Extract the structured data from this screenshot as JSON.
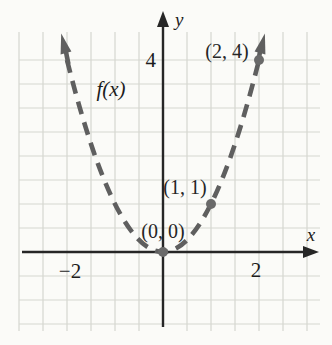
{
  "figure_title": "Graph of f(x) dashed parabola with marked points",
  "chart_data": {
    "type": "line",
    "curve_equation": "f(x) = x^2",
    "curve_label": "f(x)",
    "line_style": "dashed",
    "x_axis_label": "x",
    "y_axis_label": "y",
    "x_ticks": [
      {
        "value": -2,
        "label": "−2"
      },
      {
        "value": 2,
        "label": "2"
      }
    ],
    "y_ticks": [
      {
        "value": 4,
        "label": "4"
      }
    ],
    "points": [
      {
        "x": 0,
        "y": 0,
        "label": "(0, 0)"
      },
      {
        "x": 1,
        "y": 1,
        "label": "(1, 1)"
      },
      {
        "x": 2,
        "y": 4,
        "label": "(2, 4)"
      }
    ],
    "curve_points": [
      [
        -2,
        4
      ],
      [
        -1.5,
        2.25
      ],
      [
        -1,
        1
      ],
      [
        -0.5,
        0.25
      ],
      [
        0,
        0
      ],
      [
        0.5,
        0.25
      ],
      [
        1,
        1
      ],
      [
        1.5,
        2.25
      ],
      [
        2,
        4
      ]
    ],
    "x_range_shown": [
      -3,
      3.4
    ],
    "y_range_shown": [
      -1.9,
      5
    ],
    "grid": true,
    "grid_spacing_units": 0.5,
    "colors": {
      "background": "#fbfbf8",
      "grid": "#d6d7d0",
      "axis": "#262626",
      "curve": "#5f5f5f",
      "point": "#6a6a6a",
      "text": "#1d1d1d"
    }
  }
}
